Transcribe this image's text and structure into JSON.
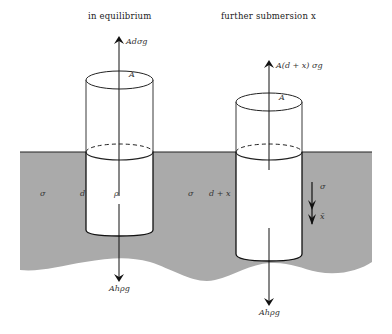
{
  "diagram": {
    "type": "buoyancy-oscillation",
    "colors": {
      "fluid": "#a9a9a9",
      "cylinder": "#ffffff",
      "stroke": "#111111",
      "background": "#ffffff"
    },
    "panels": [
      {
        "title": "in equilibrium",
        "labels": {
          "top_area": "A",
          "upward_force": "Adσg",
          "fluid_density": "σ",
          "depth": "d",
          "body_density": "ρ",
          "downward_force": "Ahρg"
        }
      },
      {
        "title": "further submersion x",
        "labels": {
          "top_area": "A",
          "upward_force": "A(d + x) σg",
          "fluid_density": "σ",
          "depth": "d + x",
          "displacement_arrow_top": "σ",
          "displacement_arrow_bottom": "x̄",
          "downward_force": "Ahρg"
        }
      }
    ]
  }
}
